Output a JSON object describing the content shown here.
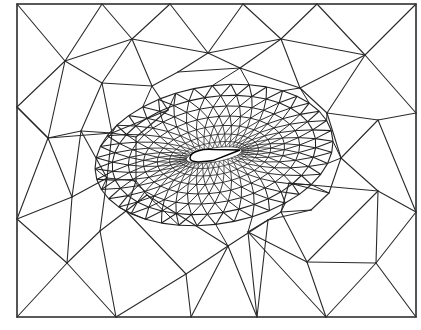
{
  "figure": {
    "type": "unstructured-triangular-mesh",
    "colors": {
      "background": "#ffffff",
      "line": "#2a2a2a",
      "airfoil_fill": "#ffffff"
    },
    "boundary": {
      "x0": 17,
      "y0": 4,
      "x1": 416,
      "y1": 317
    },
    "airfoil": {
      "le": [
        190,
        158
      ],
      "te": [
        240,
        150
      ],
      "thickness": 7
    },
    "outer_nodes": [
      [
        17,
        4
      ],
      [
        102,
        4
      ],
      [
        170,
        4
      ],
      [
        243,
        4
      ],
      [
        317,
        4
      ],
      [
        416,
        4
      ],
      [
        17,
        107
      ],
      [
        17,
        219
      ],
      [
        17,
        317
      ],
      [
        116,
        317
      ],
      [
        191,
        317
      ],
      [
        257,
        317
      ],
      [
        326,
        317
      ],
      [
        416,
        317
      ],
      [
        416,
        113
      ],
      [
        416,
        212
      ],
      [
        65,
        61
      ],
      [
        132,
        39
      ],
      [
        208,
        53
      ],
      [
        281,
        39
      ],
      [
        365,
        55
      ],
      [
        102,
        83
      ],
      [
        48,
        138
      ],
      [
        81,
        131
      ],
      [
        112,
        133
      ],
      [
        136,
        137
      ],
      [
        168,
        110
      ],
      [
        152,
        86
      ],
      [
        178,
        72
      ],
      [
        240,
        68
      ],
      [
        300,
        88
      ],
      [
        327,
        113
      ],
      [
        341,
        158
      ],
      [
        329,
        193
      ],
      [
        311,
        210
      ],
      [
        378,
        120
      ],
      [
        378,
        191
      ],
      [
        307,
        262
      ],
      [
        376,
        263
      ],
      [
        67,
        263
      ],
      [
        100,
        231
      ],
      [
        126,
        211
      ],
      [
        147,
        195
      ],
      [
        186,
        274
      ],
      [
        228,
        246
      ],
      [
        268,
        220
      ],
      [
        281,
        212
      ],
      [
        72,
        197
      ],
      [
        107,
        178
      ],
      [
        136,
        181
      ],
      [
        248,
        232
      ],
      [
        289,
        183
      ]
    ],
    "outer_edges": [
      [
        0,
        1
      ],
      [
        1,
        2
      ],
      [
        2,
        3
      ],
      [
        3,
        4
      ],
      [
        4,
        5
      ],
      [
        5,
        14
      ],
      [
        14,
        15
      ],
      [
        15,
        13
      ],
      [
        13,
        12
      ],
      [
        12,
        11
      ],
      [
        11,
        10
      ],
      [
        10,
        9
      ],
      [
        9,
        8
      ],
      [
        8,
        7
      ],
      [
        7,
        6
      ],
      [
        6,
        0
      ],
      [
        0,
        16
      ],
      [
        1,
        16
      ],
      [
        1,
        17
      ],
      [
        2,
        17
      ],
      [
        2,
        18
      ],
      [
        3,
        18
      ],
      [
        3,
        19
      ],
      [
        4,
        19
      ],
      [
        4,
        20
      ],
      [
        5,
        20
      ],
      [
        16,
        17
      ],
      [
        17,
        18
      ],
      [
        18,
        19
      ],
      [
        19,
        20
      ],
      [
        20,
        14
      ],
      [
        16,
        6
      ],
      [
        16,
        21
      ],
      [
        17,
        21
      ],
      [
        17,
        27
      ],
      [
        18,
        28
      ],
      [
        18,
        29
      ],
      [
        19,
        29
      ],
      [
        19,
        30
      ],
      [
        20,
        30
      ],
      [
        20,
        31
      ],
      [
        6,
        22
      ],
      [
        16,
        22
      ],
      [
        22,
        23
      ],
      [
        21,
        23
      ],
      [
        21,
        27
      ],
      [
        23,
        24
      ],
      [
        24,
        25
      ],
      [
        27,
        28
      ],
      [
        28,
        29
      ],
      [
        29,
        30
      ],
      [
        30,
        31
      ],
      [
        31,
        35
      ],
      [
        14,
        35
      ],
      [
        35,
        15
      ],
      [
        35,
        32
      ],
      [
        32,
        36
      ],
      [
        36,
        15
      ],
      [
        31,
        32
      ],
      [
        6,
        22
      ],
      [
        22,
        7
      ],
      [
        22,
        47
      ],
      [
        23,
        47
      ],
      [
        7,
        47
      ],
      [
        7,
        39
      ],
      [
        47,
        39
      ],
      [
        47,
        48
      ],
      [
        24,
        48
      ],
      [
        48,
        49
      ],
      [
        25,
        49
      ],
      [
        48,
        40
      ],
      [
        39,
        40
      ],
      [
        40,
        41
      ],
      [
        49,
        41
      ],
      [
        41,
        42
      ],
      [
        49,
        42
      ],
      [
        39,
        8
      ],
      [
        39,
        9
      ],
      [
        40,
        9
      ],
      [
        9,
        43
      ],
      [
        10,
        43
      ],
      [
        41,
        43
      ],
      [
        43,
        44
      ],
      [
        42,
        44
      ],
      [
        44,
        10
      ],
      [
        44,
        11
      ],
      [
        44,
        45
      ],
      [
        45,
        11
      ],
      [
        45,
        50
      ],
      [
        50,
        11
      ],
      [
        50,
        12
      ],
      [
        50,
        37
      ],
      [
        37,
        12
      ],
      [
        37,
        38
      ],
      [
        38,
        12
      ],
      [
        38,
        13
      ],
      [
        38,
        15
      ],
      [
        36,
        38
      ],
      [
        36,
        37
      ],
      [
        37,
        46
      ],
      [
        46,
        51
      ],
      [
        51,
        36
      ],
      [
        51,
        33
      ],
      [
        33,
        32
      ],
      [
        33,
        34
      ],
      [
        34,
        46
      ],
      [
        45,
        46
      ],
      [
        45,
        34
      ],
      [
        22,
        24
      ],
      [
        23,
        48
      ],
      [
        21,
        24
      ],
      [
        25,
        26
      ],
      [
        26,
        27
      ],
      [
        24,
        26
      ]
    ],
    "rings": {
      "center": [
        214,
        155
      ],
      "count": 8,
      "spokes": 40
    }
  }
}
